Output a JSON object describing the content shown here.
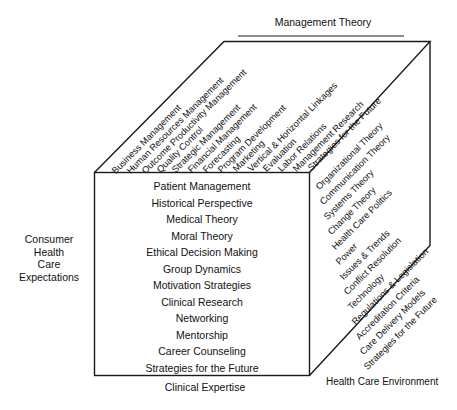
{
  "figure": {
    "title_top": "Management Theory",
    "title_bottom": "Clinical Expertise",
    "title_left_lines": [
      "Consumer",
      "Health",
      "Care",
      "Expectations"
    ],
    "line_color": "#1a1a1a",
    "text_color": "#111111",
    "background": "#ffffff"
  },
  "front_face": {
    "name": "Clinical Expertise",
    "items": [
      "Patient Management",
      "Historical Perspective",
      "Medical Theory",
      "Moral Theory",
      "Ethical Decision Making",
      "Group Dynamics",
      "Motivation Strategies",
      "Clinical Research",
      "Networking",
      "Mentorship",
      "Career Counseling",
      "Strategies for the Future"
    ]
  },
  "top_face": {
    "name": "Management Theory",
    "items": [
      "Business Management",
      "Human Resources Management",
      "Outcome Productivity Management",
      "Quality Control",
      "Strategic Management",
      "Financial Management",
      "Forecasting",
      "Program Development",
      "Marketing",
      "Vertical & Horizontal Linkages",
      "Evaluation",
      "Labor Relations",
      "Management Research",
      "Strategies for the Future"
    ]
  },
  "right_face": {
    "name": "Health Care Environment",
    "label": "Health Care Environment",
    "items": [
      "Organizational Theory",
      "Communication Theory",
      "Systems Theory",
      "Change Theory",
      "Health Care Politics",
      "Power",
      "Issues & Trends",
      "Conflict Resolution",
      "Technology",
      "Regulations & Legislation",
      "Accreditation Criteria",
      "Care Delivery Models",
      "Strategies for the Future"
    ]
  }
}
